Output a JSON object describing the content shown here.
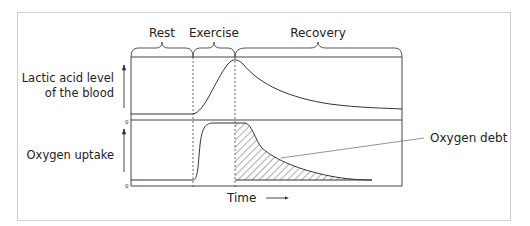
{
  "diagram": {
    "phases": [
      "Rest",
      "Exercise",
      "Recovery"
    ],
    "y_labels": {
      "top_line1": "Lactic acid level",
      "top_line2": "of the blood",
      "bottom": "Oxygen uptake"
    },
    "zero_labels": [
      "0",
      "0"
    ],
    "x_label": "Time",
    "annotation": "Oxygen debt"
  }
}
